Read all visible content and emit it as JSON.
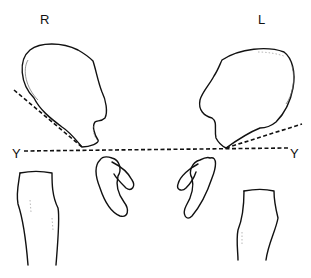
{
  "figure": {
    "labels": {
      "right_side": "R",
      "left_side": "L",
      "line_y_left": "Y",
      "line_y_right": "Y"
    }
  }
}
